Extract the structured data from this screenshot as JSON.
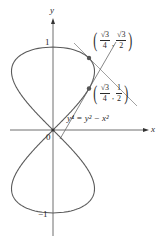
{
  "figure": {
    "axis_x_label": "x",
    "axis_y_label": "y",
    "origin_label": "0",
    "y_tick_top": "1",
    "y_tick_bottom": "−1",
    "equation": "y⁴ = y² − x²",
    "point_upper": {
      "x_num": "√3",
      "x_den": "4",
      "y_num": "√3",
      "y_den": "2",
      "value": "(√3/4, √3/2)"
    },
    "point_lower": {
      "x_num": "√3",
      "x_den": "4",
      "y_num": "1",
      "y_den": "2",
      "value": "(√3/4, 1/2)"
    },
    "tangent_upper_slope": "-1",
    "tangent_lower_slope": "√3",
    "colors": {
      "curve": "#5a5a5a",
      "axis": "#3a3a3a",
      "tangent": "#8a8a8a",
      "point": "#555555"
    }
  }
}
